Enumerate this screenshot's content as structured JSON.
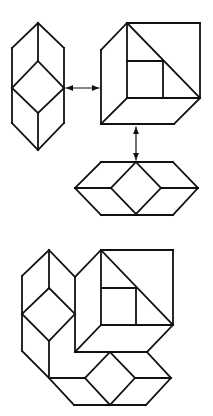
{
  "diagram": {
    "colors": {
      "stroke": "#111111",
      "background": "#ffffff"
    },
    "figures": [
      {
        "id": "vertical-hexagon",
        "lines": [
          [
            38,
            23,
            12,
            48
          ],
          [
            38,
            23,
            64,
            48
          ],
          [
            12,
            48,
            12,
            123
          ],
          [
            64,
            48,
            64,
            123
          ],
          [
            12,
            123,
            38,
            150
          ],
          [
            64,
            123,
            38,
            150
          ],
          [
            38,
            23,
            38,
            61
          ],
          [
            38,
            61,
            12,
            88
          ],
          [
            38,
            61,
            64,
            88
          ],
          [
            12,
            88,
            38,
            113
          ],
          [
            64,
            88,
            38,
            113
          ],
          [
            38,
            113,
            38,
            150
          ]
        ]
      },
      {
        "id": "cube-with-square",
        "lines": [
          [
            127,
            23,
            200,
            23
          ],
          [
            200,
            23,
            200,
            98
          ],
          [
            127,
            23,
            127,
            98
          ],
          [
            127,
            98,
            200,
            98
          ],
          [
            127,
            23,
            200,
            98
          ],
          [
            127,
            61,
            163,
            61
          ],
          [
            163,
            61,
            163,
            98
          ],
          [
            127,
            23,
            101,
            50
          ],
          [
            101,
            50,
            101,
            124
          ],
          [
            127,
            98,
            101,
            124
          ],
          [
            101,
            124,
            174,
            124
          ],
          [
            200,
            98,
            174,
            124
          ]
        ]
      },
      {
        "id": "flat-hexagon",
        "lines": [
          [
            101,
            162,
            173,
            162
          ],
          [
            101,
            162,
            75,
            188
          ],
          [
            173,
            162,
            198,
            188
          ],
          [
            75,
            188,
            101,
            215
          ],
          [
            198,
            188,
            173,
            215
          ],
          [
            101,
            215,
            173,
            215
          ],
          [
            75,
            188,
            111,
            188
          ],
          [
            161,
            188,
            198,
            188
          ],
          [
            136,
            162,
            111,
            188
          ],
          [
            136,
            162,
            161,
            188
          ],
          [
            111,
            188,
            136,
            214
          ],
          [
            161,
            188,
            136,
            214
          ]
        ]
      },
      {
        "id": "composite",
        "lines": [
          [
            49,
            250,
            22,
            276
          ],
          [
            49,
            250,
            75,
            277
          ],
          [
            22,
            276,
            22,
            351
          ],
          [
            22,
            351,
            49,
            378
          ],
          [
            49,
            250,
            49,
            288
          ],
          [
            49,
            288,
            22,
            314
          ],
          [
            49,
            288,
            75,
            314
          ],
          [
            22,
            314,
            49,
            341
          ],
          [
            75,
            314,
            49,
            341
          ],
          [
            49,
            341,
            49,
            378
          ],
          [
            75,
            277,
            75,
            352
          ],
          [
            101,
            250,
            173,
            250
          ],
          [
            173,
            250,
            173,
            325
          ],
          [
            101,
            250,
            101,
            325
          ],
          [
            101,
            325,
            173,
            325
          ],
          [
            101,
            250,
            173,
            325
          ],
          [
            101,
            288,
            136,
            288
          ],
          [
            136,
            288,
            136,
            325
          ],
          [
            101,
            250,
            75,
            277
          ],
          [
            101,
            325,
            75,
            352
          ],
          [
            75,
            352,
            147,
            352
          ],
          [
            173,
            325,
            147,
            352
          ],
          [
            49,
            378,
            74,
            405
          ],
          [
            147,
            352,
            171,
            378
          ],
          [
            171,
            378,
            146,
            405
          ],
          [
            74,
            405,
            146,
            405
          ],
          [
            49,
            378,
            85,
            378
          ],
          [
            135,
            378,
            171,
            378
          ],
          [
            110,
            352,
            85,
            378
          ],
          [
            110,
            352,
            135,
            378
          ],
          [
            85,
            378,
            110,
            405
          ],
          [
            135,
            378,
            110,
            405
          ]
        ]
      }
    ],
    "arrows": [
      {
        "id": "horizontal-double-arrow",
        "x1": 66,
        "y1": 88,
        "x2": 99,
        "y2": 88
      },
      {
        "id": "vertical-double-arrow",
        "x1": 136,
        "y1": 127,
        "x2": 136,
        "y2": 160
      }
    ]
  }
}
